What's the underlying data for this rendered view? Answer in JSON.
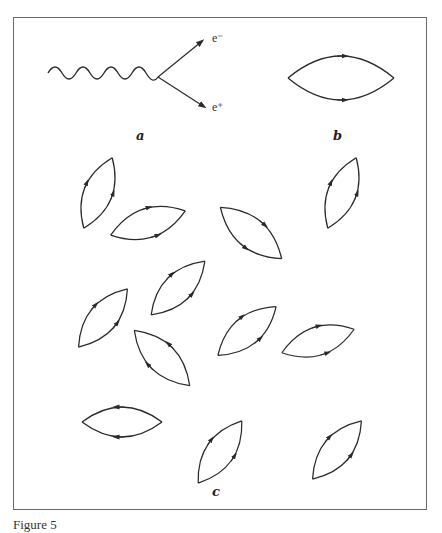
{
  "figure": {
    "panels": {
      "a": {
        "label": "a",
        "description": "photon converts to electron-positron pair",
        "outgoing": [
          "e⁻",
          "e⁺"
        ]
      },
      "b": {
        "label": "b",
        "description": "closed virtual electron-positron loop"
      },
      "c": {
        "label": "c",
        "description": "many vacuum fluctuation loops",
        "loop_count": 13
      }
    },
    "caption": "Figure 5"
  },
  "colors": {
    "line": "#2a2a2a",
    "frame": "#6a6a6a",
    "background": "#ffffff"
  }
}
